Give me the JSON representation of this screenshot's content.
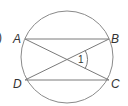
{
  "figure": {
    "prefix_mark": ")",
    "circle": {
      "cx": 67,
      "cy": 57,
      "r": 46
    },
    "points": {
      "A": {
        "label": "A",
        "x": 25,
        "y": 39
      },
      "B": {
        "label": "B",
        "x": 109,
        "y": 39
      },
      "C": {
        "label": "C",
        "x": 109,
        "y": 80
      },
      "D": {
        "label": "D",
        "x": 25,
        "y": 80
      }
    },
    "segments": [
      "AB",
      "DC",
      "AC",
      "BD"
    ],
    "angle": {
      "label": "1",
      "vertex": "intersection of AC and BD"
    },
    "colors": {
      "stroke": "#8a8a8a",
      "text": "#333333"
    }
  }
}
